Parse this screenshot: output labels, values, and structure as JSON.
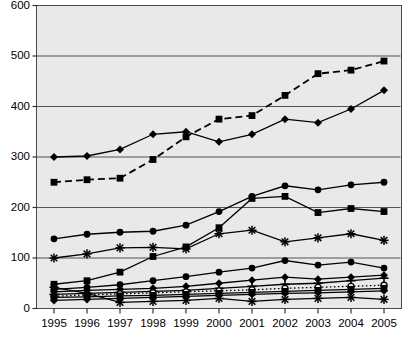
{
  "chart_data": {
    "type": "line",
    "title": "",
    "subtitle": "",
    "xlabel": "",
    "ylabel": "",
    "categories": [
      "1995",
      "1996",
      "1997",
      "1998",
      "1999",
      "2000",
      "2001",
      "2002",
      "2003",
      "2004",
      "2005"
    ],
    "x": [
      1995,
      1996,
      1997,
      1998,
      1999,
      2000,
      2001,
      2002,
      2003,
      2004,
      2005
    ],
    "ylim": [
      0,
      600
    ],
    "yticks": [
      0,
      100,
      200,
      300,
      400,
      500,
      600
    ],
    "ytick_labels": [
      "0",
      "100",
      "200",
      "300",
      "400",
      "500",
      "600"
    ],
    "xtick_labels": [
      "1995",
      "1996",
      "1997",
      "1998",
      "1999",
      "2000",
      "2001",
      "2002",
      "2003",
      "2004",
      "2005"
    ],
    "grid": "horizontal",
    "legend": "none",
    "plot_background": "#e9e9e9",
    "frame_color": "#4a4a4a",
    "gridline_color": "#555555",
    "series_color": "#000000",
    "series": [
      {
        "name": "Series 1",
        "marker": "square",
        "linestyle": "dashed",
        "values": [
          250,
          255,
          258,
          295,
          340,
          375,
          382,
          422,
          465,
          472,
          490
        ]
      },
      {
        "name": "Series 2",
        "marker": "diamond",
        "linestyle": "solid",
        "values": [
          300,
          302,
          315,
          345,
          350,
          330,
          345,
          375,
          368,
          395,
          432
        ]
      },
      {
        "name": "Series 3",
        "marker": "circle",
        "linestyle": "solid",
        "values": [
          138,
          147,
          151,
          153,
          165,
          192,
          222,
          243,
          235,
          245,
          250
        ]
      },
      {
        "name": "Series 4",
        "marker": "square",
        "linestyle": "solid",
        "values": [
          48,
          55,
          72,
          103,
          122,
          160,
          218,
          222,
          190,
          198,
          192
        ]
      },
      {
        "name": "Series 5",
        "marker": "star",
        "linestyle": "solid",
        "values": [
          100,
          108,
          120,
          121,
          118,
          148,
          155,
          132,
          140,
          148,
          135
        ]
      },
      {
        "name": "Series 6",
        "marker": "circle",
        "linestyle": "solid",
        "values": [
          38,
          42,
          47,
          55,
          63,
          72,
          80,
          95,
          86,
          92,
          80
        ]
      },
      {
        "name": "Series 7",
        "marker": "diamond",
        "linestyle": "solid",
        "values": [
          33,
          36,
          38,
          40,
          44,
          50,
          56,
          62,
          58,
          62,
          66
        ]
      },
      {
        "name": "Series 8",
        "marker": "plus",
        "linestyle": "solid",
        "values": [
          28,
          30,
          32,
          34,
          36,
          40,
          44,
          48,
          50,
          55,
          60
        ]
      },
      {
        "name": "Series 9",
        "marker": "circle-open",
        "linestyle": "dotted",
        "values": [
          24,
          27,
          29,
          31,
          33,
          35,
          37,
          40,
          42,
          44,
          46
        ]
      },
      {
        "name": "Series 10",
        "marker": "square",
        "linestyle": "solid",
        "values": [
          22,
          23,
          25,
          26,
          28,
          30,
          32,
          34,
          36,
          38,
          40
        ]
      },
      {
        "name": "Series 11",
        "marker": "diamond",
        "linestyle": "solid",
        "values": [
          16,
          18,
          20,
          22,
          24,
          26,
          28,
          30,
          31,
          33,
          35
        ]
      },
      {
        "name": "Series 12",
        "marker": "star",
        "linestyle": "solid",
        "values": [
          42,
          30,
          12,
          14,
          16,
          20,
          14,
          18,
          20,
          22,
          18
        ]
      }
    ]
  }
}
